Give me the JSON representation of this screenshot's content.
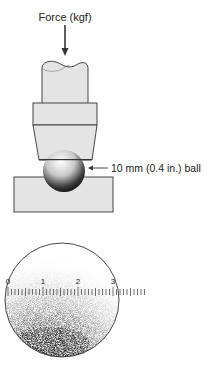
{
  "diagram": {
    "type": "brinell-hardness-test",
    "force_label": "Force (kgf)",
    "ball_label": "10 mm (0.4 in.) ball",
    "scale": {
      "tick_labels": [
        "0",
        "1",
        "2",
        "3"
      ],
      "minor_divisions_per_unit": 10
    },
    "colors": {
      "part_fill": "#e4e4e4",
      "outline": "#333333",
      "ball_dark": "#1a1a1a",
      "ball_light": "#ffffff"
    }
  }
}
